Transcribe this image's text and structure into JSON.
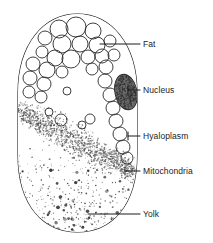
{
  "figure": {
    "background_color": "#ffffff",
    "outline_color": "#1b1b1b",
    "label_color": "#1b1b1b"
  },
  "cell": {
    "name": "cell-outline",
    "shape": "oval",
    "bounds": {
      "x": 18,
      "y": 14,
      "width": 119,
      "height": 218
    }
  },
  "labels": [
    {
      "id": "fat",
      "text": "Fat",
      "text_x": 143,
      "text_y": 40,
      "leader": {
        "x1": 100,
        "y1": 44,
        "x2": 140,
        "y2": 44
      }
    },
    {
      "id": "nucleus",
      "text": "Nucleus",
      "text_x": 143,
      "text_y": 86,
      "leader": {
        "x1": 128,
        "y1": 90,
        "x2": 140,
        "y2": 90
      }
    },
    {
      "id": "hyaloplasm",
      "text": "Hyaloplasm",
      "text_x": 143,
      "text_y": 132,
      "leader": {
        "x1": 128,
        "y1": 136,
        "x2": 140,
        "y2": 136
      }
    },
    {
      "id": "mitochondria",
      "text": "Mitochondria",
      "text_x": 143,
      "text_y": 167,
      "leader": {
        "x1": 125,
        "y1": 171,
        "x2": 140,
        "y2": 171
      }
    },
    {
      "id": "yolk",
      "text": "Yolk",
      "text_x": 143,
      "text_y": 210,
      "leader": {
        "x1": 88,
        "y1": 214,
        "x2": 140,
        "y2": 214
      }
    }
  ],
  "structures": {
    "fat_globules": {
      "name": "fat-globules",
      "description": "open circles of varying radius in the upper cytoplasm",
      "stroke": "#2a2a2a",
      "fill": "none",
      "circles": [
        {
          "cx": 59,
          "cy": 29,
          "r": 9
        },
        {
          "cx": 76,
          "cy": 27,
          "r": 10
        },
        {
          "cx": 93,
          "cy": 31,
          "r": 8
        },
        {
          "cx": 45,
          "cy": 38,
          "r": 7
        },
        {
          "cx": 62,
          "cy": 44,
          "r": 9
        },
        {
          "cx": 80,
          "cy": 44,
          "r": 8
        },
        {
          "cx": 97,
          "cy": 45,
          "r": 8
        },
        {
          "cx": 110,
          "cy": 41,
          "r": 6
        },
        {
          "cx": 42,
          "cy": 52,
          "r": 6
        },
        {
          "cx": 55,
          "cy": 58,
          "r": 8
        },
        {
          "cx": 71,
          "cy": 59,
          "r": 9
        },
        {
          "cx": 88,
          "cy": 57,
          "r": 7
        },
        {
          "cx": 102,
          "cy": 56,
          "r": 7
        },
        {
          "cx": 114,
          "cy": 55,
          "r": 6
        },
        {
          "cx": 33,
          "cy": 64,
          "r": 7
        },
        {
          "cx": 47,
          "cy": 70,
          "r": 8
        },
        {
          "cx": 62,
          "cy": 72,
          "r": 6
        },
        {
          "cx": 92,
          "cy": 69,
          "r": 6
        },
        {
          "cx": 106,
          "cy": 67,
          "r": 7
        },
        {
          "cx": 30,
          "cy": 78,
          "r": 7
        },
        {
          "cx": 44,
          "cy": 84,
          "r": 7
        },
        {
          "cx": 29,
          "cy": 92,
          "r": 6
        },
        {
          "cx": 41,
          "cy": 97,
          "r": 6
        },
        {
          "cx": 105,
          "cy": 81,
          "r": 7
        },
        {
          "cx": 110,
          "cy": 95,
          "r": 7
        },
        {
          "cx": 113,
          "cy": 108,
          "r": 7
        },
        {
          "cx": 116,
          "cy": 121,
          "r": 7
        },
        {
          "cx": 120,
          "cy": 134,
          "r": 7
        },
        {
          "cx": 123,
          "cy": 147,
          "r": 7
        },
        {
          "cx": 127,
          "cy": 158,
          "r": 6
        },
        {
          "cx": 67,
          "cy": 91,
          "r": 4
        },
        {
          "cx": 61,
          "cy": 120,
          "r": 6
        },
        {
          "cx": 82,
          "cy": 125,
          "r": 4
        },
        {
          "cx": 90,
          "cy": 119,
          "r": 5
        },
        {
          "cx": 49,
          "cy": 112,
          "r": 4
        }
      ]
    },
    "nucleus": {
      "name": "nucleus",
      "description": "dark stippled oval near the right margin",
      "cx": 126,
      "cy": 92,
      "rx": 11,
      "ry": 18,
      "rotation": -12,
      "fill": "#6e6e6e",
      "stroke": "#2a2a2a"
    },
    "hyaloplasm": {
      "name": "hyaloplasm",
      "description": "clear ground cytoplasm filling the cell interior",
      "fill": "#ffffff"
    },
    "mitochondria": {
      "name": "mitochondria-band",
      "description": "dense diagonal stipple band sweeping from the left margin down to the lower right",
      "color": "#555555",
      "dot_count": 1500
    },
    "yolk": {
      "name": "yolk-granules",
      "description": "fine dark granules filling the lower third of the cell",
      "color": "#2a2a2a",
      "dot_count": 900
    }
  }
}
